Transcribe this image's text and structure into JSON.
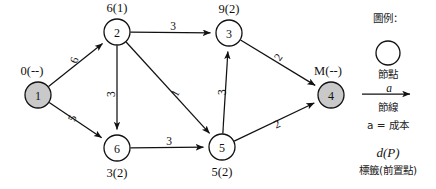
{
  "figure": {
    "kind": "shortest-path-network-diagram",
    "colors": {
      "stroke": "#111111",
      "node_fill_plain": "#ffffff",
      "node_fill_shaded": "#c9c9c9",
      "background": "#ffffff"
    }
  },
  "nodes": [
    {
      "id": "1",
      "label": "0(--)",
      "shaded": true,
      "cx": 38,
      "cy": 95,
      "r": 13,
      "label_dx": -6,
      "label_dy": -24
    },
    {
      "id": "2",
      "label": "6(1)",
      "shaded": false,
      "cx": 117,
      "cy": 32,
      "r": 13,
      "label_dx": 0,
      "label_dy": -24
    },
    {
      "id": "3",
      "label": "9(2)",
      "shaded": false,
      "cx": 229,
      "cy": 33,
      "r": 13,
      "label_dx": 0,
      "label_dy": -24
    },
    {
      "id": "4",
      "label": "M(--)",
      "shaded": true,
      "cx": 331,
      "cy": 95,
      "r": 13,
      "label_dx": -3,
      "label_dy": -24
    },
    {
      "id": "5",
      "label": "5(2)",
      "shaded": false,
      "cx": 222,
      "cy": 147,
      "r": 13,
      "label_dx": 0,
      "label_dy": 25
    },
    {
      "id": "6",
      "label": "3(2)",
      "shaded": false,
      "cx": 117,
      "cy": 148,
      "r": 13,
      "label_dx": 0,
      "label_dy": 25
    }
  ],
  "edges": [
    {
      "from": "1",
      "to": "2",
      "cost": "6",
      "label_x": 74,
      "label_y": 60,
      "label_rotate": -72
    },
    {
      "from": "1",
      "to": "6",
      "cost": "5",
      "label_x": 72,
      "label_y": 118,
      "label_rotate": -68
    },
    {
      "from": "2",
      "to": "3",
      "cost": "3",
      "label_x": 173,
      "label_y": 26,
      "label_rotate": 0
    },
    {
      "from": "2",
      "to": "6",
      "cost": "3",
      "label_x": 111,
      "label_y": 94,
      "label_rotate": -90
    },
    {
      "from": "2",
      "to": "5",
      "cost": "1",
      "label_x": 175,
      "label_y": 93,
      "label_rotate": -62
    },
    {
      "from": "6",
      "to": "5",
      "cost": "3",
      "label_x": 169,
      "label_y": 141,
      "label_rotate": 0
    },
    {
      "from": "5",
      "to": "3",
      "cost": "3",
      "label_x": 222,
      "label_y": 92,
      "label_rotate": -90
    },
    {
      "from": "3",
      "to": "4",
      "cost": "2",
      "label_x": 278,
      "label_y": 57,
      "label_rotate": -55
    },
    {
      "from": "5",
      "to": "4",
      "cost": "2",
      "label_x": 277,
      "label_y": 124,
      "label_rotate": -25
    }
  ],
  "legend": {
    "title": "圖例：",
    "node_symbol_caption": "節點",
    "arc_symbol_cost_letter": "a",
    "arc_symbol_caption": "節線",
    "cost_definition": "a = 成本",
    "label_notation": "d(P)",
    "label_notation_caption": "標籤(前置點)"
  }
}
